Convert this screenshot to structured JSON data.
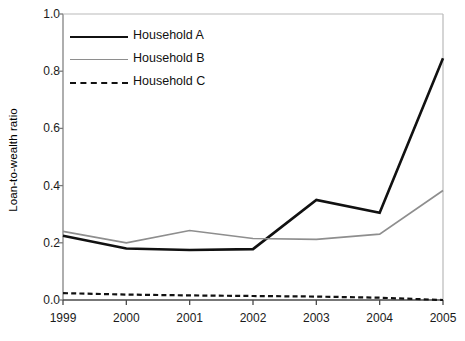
{
  "chart_data": {
    "type": "line",
    "title": "",
    "xlabel": "",
    "ylabel": "Loan-to-wealth ratio",
    "categories": [
      "1999",
      "2000",
      "2001",
      "2002",
      "2003",
      "2004",
      "2005"
    ],
    "x": [
      1999,
      2000,
      2001,
      2002,
      2003,
      2004,
      2005
    ],
    "xlim": [
      1999,
      2005
    ],
    "ylim": [
      0.0,
      1.0
    ],
    "ytick_labels": [
      "0.0",
      "0.2",
      "0.4",
      "0.6",
      "0.8",
      "1.0"
    ],
    "ytick_values": [
      0.0,
      0.2,
      0.4,
      0.6,
      0.8,
      1.0
    ],
    "grid": false,
    "legend_position": "top-left",
    "series": [
      {
        "name": "Household A",
        "style": "solid",
        "color": "#111111",
        "width": 2.6,
        "values": [
          0.225,
          0.18,
          0.175,
          0.178,
          0.35,
          0.305,
          0.845
        ]
      },
      {
        "name": "Household B",
        "style": "solid",
        "color": "#8e8e8e",
        "width": 1.7,
        "values": [
          0.24,
          0.2,
          0.243,
          0.215,
          0.212,
          0.23,
          0.383
        ]
      },
      {
        "name": "Household C",
        "style": "dashed",
        "color": "#111111",
        "width": 2.2,
        "values": [
          0.024,
          0.019,
          0.016,
          0.014,
          0.012,
          0.008,
          0.0
        ]
      }
    ]
  },
  "axes": {
    "y_axis_name": "y-axis",
    "x_axis_name": "x-axis"
  }
}
